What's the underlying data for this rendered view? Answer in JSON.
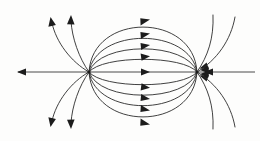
{
  "figure": {
    "title": "Electric field lines of a dipole",
    "type": "vector-field-diagram",
    "background_color": "#fdfdfc",
    "line_color": "#2b2b2b",
    "axis_color": "#4a4a4a",
    "arrow_color": "#1c1c1c",
    "width": 260,
    "height": 141
  },
  "chart_data": {
    "type": "line",
    "title": "Electric field lines of a dipole",
    "subtitle": "",
    "xlabel": "",
    "ylabel": "",
    "xlim": [
      0,
      260
    ],
    "ylim": [
      0,
      141
    ],
    "grid": false,
    "legend": "none",
    "annotations": [],
    "poles": [
      {
        "name": "source-pole-left",
        "polarity": "positive",
        "x": 89,
        "y": 72,
        "flow": "outward"
      },
      {
        "name": "sink-pole-right",
        "polarity": "negative",
        "x": 197,
        "y": 72,
        "flow": "inward"
      }
    ],
    "series": [
      {
        "name": "axis-line-left",
        "direction": "leftward",
        "values": [
          [
            89,
            72
          ],
          [
            16,
            72
          ]
        ]
      },
      {
        "name": "axis-line-right",
        "direction": "leftward",
        "values": [
          [
            255,
            72
          ],
          [
            197,
            72
          ]
        ]
      },
      {
        "name": "axis-line-center",
        "direction": "rightward",
        "values": [
          [
            89,
            72
          ],
          [
            197,
            72
          ]
        ]
      },
      {
        "name": "inner-arc-up-1",
        "direction": "rightward",
        "values": [
          [
            89,
            72
          ],
          [
            143,
            53
          ],
          [
            197,
            72
          ]
        ]
      },
      {
        "name": "inner-arc-up-2",
        "direction": "rightward",
        "values": [
          [
            89,
            72
          ],
          [
            143,
            41
          ],
          [
            197,
            72
          ]
        ]
      },
      {
        "name": "inner-arc-up-3",
        "direction": "rightward",
        "values": [
          [
            89,
            72
          ],
          [
            143,
            29
          ],
          [
            197,
            72
          ]
        ]
      },
      {
        "name": "inner-arc-up-4",
        "direction": "rightward",
        "values": [
          [
            89,
            72
          ],
          [
            143,
            16
          ],
          [
            197,
            72
          ]
        ]
      },
      {
        "name": "inner-arc-down-1",
        "direction": "rightward",
        "values": [
          [
            89,
            72
          ],
          [
            143,
            91
          ],
          [
            197,
            72
          ]
        ]
      },
      {
        "name": "inner-arc-down-2",
        "direction": "rightward",
        "values": [
          [
            89,
            72
          ],
          [
            143,
            103
          ],
          [
            197,
            72
          ]
        ]
      },
      {
        "name": "inner-arc-down-3",
        "direction": "rightward",
        "values": [
          [
            89,
            72
          ],
          [
            143,
            115
          ],
          [
            197,
            72
          ]
        ]
      },
      {
        "name": "inner-arc-down-4",
        "direction": "rightward",
        "values": [
          [
            89,
            72
          ],
          [
            143,
            128
          ],
          [
            197,
            72
          ]
        ]
      },
      {
        "name": "outer-arc-upper-left-inner",
        "direction": "outward-up",
        "values": [
          [
            89,
            72
          ],
          [
            73,
            40
          ],
          [
            71,
            17
          ]
        ]
      },
      {
        "name": "outer-arc-upper-left-outer",
        "direction": "outward-up",
        "values": [
          [
            89,
            72
          ],
          [
            58,
            44
          ],
          [
            51,
            19
          ]
        ]
      },
      {
        "name": "outer-arc-lower-left-inner",
        "direction": "outward-down",
        "values": [
          [
            89,
            72
          ],
          [
            73,
            104
          ],
          [
            71,
            127
          ]
        ]
      },
      {
        "name": "outer-arc-lower-left-outer",
        "direction": "outward-down",
        "values": [
          [
            89,
            72
          ],
          [
            58,
            100
          ],
          [
            51,
            125
          ]
        ]
      },
      {
        "name": "outer-arc-upper-right-inner",
        "direction": "inward-down",
        "values": [
          [
            213,
            17
          ],
          [
            214,
            40
          ],
          [
            197,
            72
          ]
        ]
      },
      {
        "name": "outer-arc-upper-right-outer",
        "direction": "inward-down",
        "values": [
          [
            234,
            19
          ],
          [
            229,
            44
          ],
          [
            197,
            72
          ]
        ]
      },
      {
        "name": "outer-arc-lower-right-inner",
        "direction": "inward-up",
        "values": [
          [
            213,
            127
          ],
          [
            214,
            104
          ],
          [
            197,
            72
          ]
        ]
      },
      {
        "name": "outer-arc-lower-right-outer",
        "direction": "inward-up",
        "values": [
          [
            234,
            125
          ],
          [
            229,
            100
          ],
          [
            197,
            72
          ]
        ]
      }
    ],
    "arrow_count": 19
  }
}
